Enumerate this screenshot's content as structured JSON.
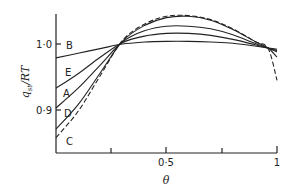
{
  "chart_data": {
    "type": "line",
    "title": "",
    "xlabel": "θ",
    "ylabel": "q_st / RT",
    "xlim": [
      0,
      1
    ],
    "ylim": [
      0.835,
      1.06
    ],
    "grid": false,
    "legend": "curve labels placed at left edge (B, E, A, D, C)",
    "x_ticks": [
      0,
      0.25,
      0.5,
      0.75,
      1
    ],
    "x_tick_labels": [
      "",
      "",
      "0·5",
      "",
      "1"
    ],
    "y_ticks": [
      0.9,
      1.0
    ],
    "y_tick_labels": [
      "0·9",
      "1·0"
    ],
    "x": [
      0,
      0.1,
      0.2,
      0.3,
      0.4,
      0.5,
      0.6,
      0.7,
      0.8,
      0.9,
      0.96,
      1.0
    ],
    "series": [
      {
        "name": "B",
        "style": "solid",
        "values": [
          0.979,
          0.986,
          0.993,
          1.0,
          1.003,
          1.004,
          1.004,
          1.003,
          1.001,
          0.997,
          0.994,
          0.992
        ]
      },
      {
        "name": "E",
        "style": "solid",
        "values": [
          0.933,
          0.955,
          0.98,
          1.002,
          1.012,
          1.016,
          1.016,
          1.013,
          1.007,
          0.999,
          0.994,
          0.99
        ]
      },
      {
        "name": "A",
        "style": "solid",
        "values": [
          0.903,
          0.933,
          0.968,
          1.003,
          1.02,
          1.027,
          1.027,
          1.023,
          1.014,
          1.001,
          0.994,
          0.988
        ]
      },
      {
        "name": "D",
        "style": "solid",
        "values": [
          0.871,
          0.908,
          0.956,
          1.004,
          1.028,
          1.04,
          1.042,
          1.036,
          1.022,
          1.004,
          0.994,
          0.98
        ]
      },
      {
        "name": "C",
        "style": "dashed",
        "values": [
          0.858,
          0.898,
          0.952,
          1.005,
          1.03,
          1.042,
          1.043,
          1.037,
          1.023,
          1.004,
          0.993,
          0.945
        ]
      }
    ],
    "annotations": []
  },
  "axes": {
    "xlabel": "θ",
    "ylabel": "q_st / RT",
    "ylabel_main": "q",
    "ylabel_sub": "st",
    "ylabel_rest": "/RT",
    "x_tick_labels": [
      "0·5",
      "1"
    ],
    "y_tick_labels": [
      "1·0",
      "0·9"
    ]
  },
  "curve_labels": [
    "B",
    "E",
    "A",
    "D",
    "C"
  ]
}
